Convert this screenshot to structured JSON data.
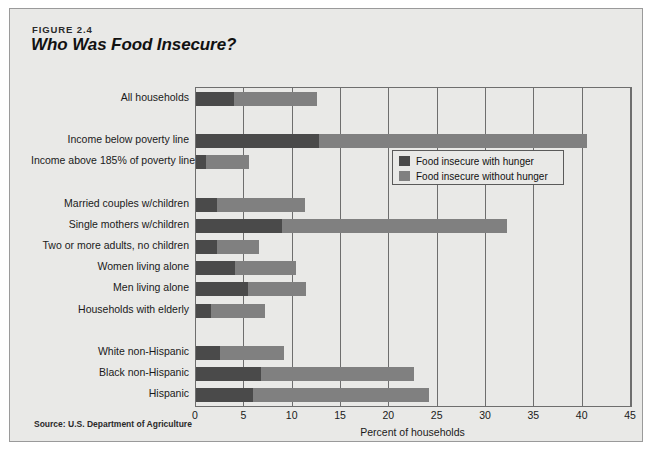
{
  "figure": {
    "number": "FIGURE 2.4",
    "title": "Who Was Food Insecure?",
    "source": "Source: U.S. Department of Agriculture"
  },
  "colors": {
    "with_hunger": "#4a4a4a",
    "without_hunger": "#808080",
    "panel_background": "#e9e9e7",
    "axis": "#6e6e6e"
  },
  "chart_data": {
    "type": "bar",
    "orientation": "horizontal",
    "stacked": true,
    "title": "Who Was Food Insecure?",
    "xlabel": "Percent of households",
    "ylabel": "",
    "xlim": [
      0,
      45
    ],
    "xticks": [
      0,
      5,
      10,
      15,
      20,
      25,
      30,
      35,
      40,
      45
    ],
    "xtick_labels": [
      "0",
      "5",
      "10",
      "15",
      "20",
      "25",
      "30",
      "35",
      "40",
      "45"
    ],
    "grid": true,
    "legend_position": "inside-upper-right",
    "categories": [
      "All households",
      "Income below poverty line",
      "Income above 185% of poverty line",
      "Married couples w/children",
      "Single mothers w/children",
      "Two or more adults, no children",
      "Women living alone",
      "Men living alone",
      "Households with elderly",
      "White non-Hispanic",
      "Black non-Hispanic",
      "Hispanic"
    ],
    "group_breaks_after": [
      0,
      2,
      8
    ],
    "series": [
      {
        "name": "Food insecure with hunger",
        "color": "#4a4a4a",
        "values": [
          3.9,
          12.7,
          1.0,
          2.2,
          8.9,
          2.2,
          4.0,
          5.4,
          1.5,
          2.5,
          6.7,
          5.9
        ]
      },
      {
        "name": "Food insecure without hunger",
        "color": "#808080",
        "values": [
          8.6,
          27.8,
          4.5,
          9.1,
          23.3,
          4.3,
          6.3,
          6.0,
          5.6,
          6.6,
          15.9,
          18.2
        ]
      }
    ],
    "totals": [
      12.5,
      40.5,
      5.5,
      11.3,
      32.2,
      6.5,
      10.3,
      11.4,
      7.1,
      9.1,
      22.6,
      24.1
    ]
  },
  "legend": {
    "items": [
      {
        "label": "Food insecure with hunger",
        "color": "#4a4a4a"
      },
      {
        "label": "Food insecure without hunger",
        "color": "#808080"
      }
    ]
  }
}
